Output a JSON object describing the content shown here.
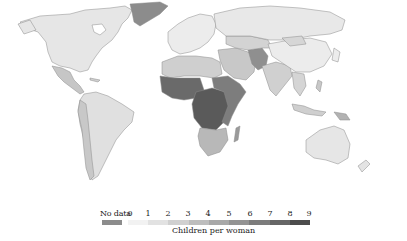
{
  "map": {
    "type": "choropleth",
    "projection": "world",
    "variable": "Children per woman",
    "fill_scale": {
      "min": 0,
      "max": 9,
      "colors": [
        "#f2f2f2",
        "#e2e2e2",
        "#d0d0d0",
        "#bdbdbd",
        "#a8a8a8",
        "#939393",
        "#7c7c7c",
        "#666666",
        "#4c4c4c"
      ]
    },
    "regions": [
      {
        "name": "North America",
        "shade": "#e6e6e6",
        "approx_value": 1.8
      },
      {
        "name": "Greenland",
        "shade": "#8c8c8c",
        "approx_value": null
      },
      {
        "name": "Central America",
        "shade": "#c6c6c6",
        "approx_value": 2.5
      },
      {
        "name": "South America",
        "shade": "#e0e0e0",
        "approx_value": 2.0
      },
      {
        "name": "Europe",
        "shade": "#ececec",
        "approx_value": 1.6
      },
      {
        "name": "North Africa",
        "shade": "#cfcfcf",
        "approx_value": 3.0
      },
      {
        "name": "West Africa",
        "shade": "#6a6a6a",
        "approx_value": 6.0
      },
      {
        "name": "Central Africa",
        "shade": "#5a5a5a",
        "approx_value": 6.5
      },
      {
        "name": "East Africa",
        "shade": "#7d7d7d",
        "approx_value": 5.5
      },
      {
        "name": "Southern Africa",
        "shade": "#b8b8b8",
        "approx_value": 3.0
      },
      {
        "name": "Madagascar",
        "shade": "#9a9a9a",
        "approx_value": 4.5
      },
      {
        "name": "Middle East",
        "shade": "#c8c8c8",
        "approx_value": 3.0
      },
      {
        "name": "Afghanistan/Pakistan",
        "shade": "#8f8f8f",
        "approx_value": 5.0
      },
      {
        "name": "Central Asia",
        "shade": "#d3d3d3",
        "approx_value": 2.5
      },
      {
        "name": "Russia",
        "shade": "#e8e8e8",
        "approx_value": 1.6
      },
      {
        "name": "India",
        "shade": "#d0d0d0",
        "approx_value": 2.6
      },
      {
        "name": "China",
        "shade": "#ececec",
        "approx_value": 1.6
      },
      {
        "name": "Southeast Asia",
        "shade": "#d5d5d5",
        "approx_value": 2.4
      },
      {
        "name": "Papua New Guinea",
        "shade": "#b2b2b2",
        "approx_value": 3.8
      },
      {
        "name": "Australia",
        "shade": "#e6e6e6",
        "approx_value": 1.9
      },
      {
        "name": "New Zealand",
        "shade": "#e4e4e4",
        "approx_value": 2.0
      }
    ]
  },
  "legend": {
    "no_data_label": "No data",
    "no_data_color": "#8c8c8c",
    "ticks": [
      "0",
      "1",
      "2",
      "3",
      "4",
      "5",
      "6",
      "7",
      "8",
      "9"
    ],
    "title": "Children per woman"
  }
}
